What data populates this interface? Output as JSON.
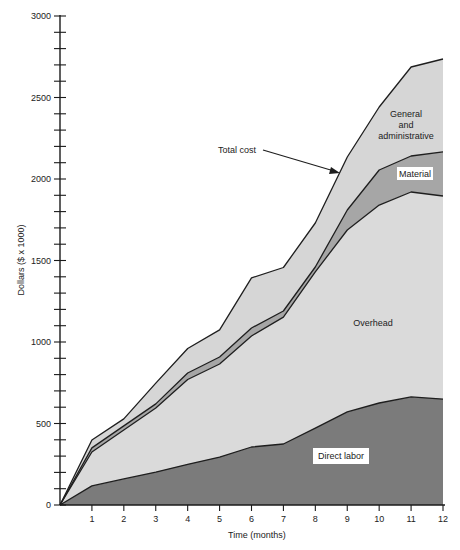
{
  "chart_data": {
    "type": "area",
    "stacked": true,
    "title": "",
    "xlabel": "Time (months)",
    "ylabel": "Dollars ($ x 1000)",
    "x": [
      0,
      1,
      2,
      3,
      4,
      5,
      6,
      7,
      8,
      9,
      10,
      11,
      12
    ],
    "x_tick_labels": [
      "1",
      "2",
      "3",
      "4",
      "5",
      "6",
      "7",
      "8",
      "9",
      "10",
      "11",
      "12"
    ],
    "y_tick_labels": [
      "0",
      "500",
      "1000",
      "1500",
      "2000",
      "2500",
      "3000"
    ],
    "xlim": [
      0,
      12
    ],
    "ylim": [
      0,
      3000
    ],
    "y_minor_tick_step": 100,
    "grid": false,
    "legend": "none (inline area labels)",
    "cumulative_boundaries": {
      "direct_labor": [
        0,
        117,
        160,
        202,
        250,
        294,
        356,
        374,
        472,
        571,
        626,
        663,
        650
      ],
      "overhead_top": [
        0,
        325,
        460,
        595,
        770,
        865,
        1037,
        1153,
        1430,
        1687,
        1840,
        1920,
        1896
      ],
      "material_top": [
        0,
        350,
        485,
        620,
        810,
        908,
        1086,
        1190,
        1460,
        1810,
        2055,
        2141,
        2166
      ],
      "total_cost": [
        0,
        399,
        528,
        748,
        960,
        1074,
        1393,
        1457,
        1730,
        2135,
        2442,
        2687,
        2736
      ]
    },
    "series": [
      {
        "name": "Direct labor",
        "values": [
          0,
          117,
          160,
          202,
          250,
          294,
          356,
          374,
          472,
          571,
          626,
          663,
          650
        ],
        "color": "#7b7b7b"
      },
      {
        "name": "Overhead",
        "values": [
          0,
          208,
          300,
          393,
          520,
          571,
          681,
          779,
          958,
          1116,
          1214,
          1257,
          1246
        ],
        "color": "#dadada"
      },
      {
        "name": "Material",
        "values": [
          0,
          25,
          25,
          25,
          40,
          43,
          49,
          37,
          30,
          123,
          215,
          221,
          270
        ],
        "color": "#a6a6a6"
      },
      {
        "name": "General and administrative",
        "values": [
          0,
          49,
          43,
          128,
          150,
          166,
          307,
          267,
          270,
          325,
          387,
          546,
          570
        ],
        "color": "#d6d6d6"
      }
    ],
    "annotations": [
      {
        "text": "Total cost",
        "arrow_to": "total_cost line near month 9"
      },
      {
        "text_lines": [
          "General",
          "and",
          "administrative"
        ]
      },
      {
        "text": "Material",
        "boxed": true
      },
      {
        "text": "Overhead"
      },
      {
        "text": "Direct labor",
        "boxed": true
      }
    ]
  },
  "labels": {
    "ylabel": "Dollars ($ x 1000)",
    "xlabel": "Time (months)",
    "total_cost": "Total cost",
    "ga_line1": "General",
    "ga_line2": "and",
    "ga_line3": "administrative",
    "material": "Material",
    "overhead": "Overhead",
    "direct_labor": "Direct labor"
  },
  "colors": {
    "labor": "#7b7b7b",
    "overhead": "#dadada",
    "material": "#a6a6a6",
    "ga": "#d6d6d6",
    "line": "#1e1e1e",
    "axis": "#1a1a1a",
    "label_box": "#ffffff"
  }
}
